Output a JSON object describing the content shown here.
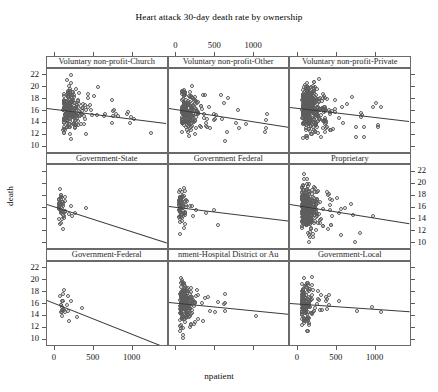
{
  "chart_data": {
    "type": "scatter",
    "title": "Heart attack 30-day death rate by ownership",
    "xlabel": "npatient",
    "ylabel": "death",
    "xlim": [
      -90,
      1450
    ],
    "ylim": [
      9.0,
      23.0
    ],
    "xticks": [
      0,
      500,
      1000
    ],
    "yticks": [
      10,
      12,
      14,
      16,
      18,
      20,
      22
    ],
    "xtick_labels": [
      "0",
      "500",
      "1000"
    ],
    "ytick_labels": [
      "10",
      "12",
      "14",
      "16",
      "18",
      "20",
      "22"
    ],
    "grid": false,
    "legend": "none",
    "layout": {
      "rows": 3,
      "cols": 3,
      "axis_style": "alternating-lattice"
    },
    "panels": [
      {
        "label": "Voluntary non-profit-Church",
        "row": 0,
        "col": 0,
        "n": 230,
        "fit": {
          "intercept": 16.25,
          "slope": -0.00165
        },
        "cluster": {
          "x_mode": 120,
          "x_spread": 210,
          "x_tail": 1150,
          "y_sd": 1.85,
          "seed": 11
        }
      },
      {
        "label": "Voluntary non-profit-Other",
        "row": 0,
        "col": 1,
        "n": 210,
        "fit": {
          "intercept": 16.15,
          "slope": -0.00205
        },
        "cluster": {
          "x_mode": 80,
          "x_spread": 160,
          "x_tail": 1100,
          "y_sd": 1.8,
          "seed": 29
        }
      },
      {
        "label": "Voluntary non-profit-Private",
        "row": 0,
        "col": 2,
        "n": 420,
        "fit": {
          "intercept": 16.3,
          "slope": -0.00155
        },
        "cluster": {
          "x_mode": 70,
          "x_spread": 180,
          "x_tail": 1050,
          "y_sd": 1.9,
          "seed": 47
        }
      },
      {
        "label": "Government-State",
        "row": 1,
        "col": 0,
        "n": 46,
        "fit": {
          "intercept": 16.1,
          "slope": -0.0042
        },
        "cluster": {
          "x_mode": 60,
          "x_spread": 90,
          "x_tail": 700,
          "y_sd": 1.5,
          "seed": 61
        }
      },
      {
        "label": "Government Federal",
        "row": 1,
        "col": 1,
        "n": 78,
        "fit": {
          "intercept": 16.0,
          "slope": -0.0016
        },
        "cluster": {
          "x_mode": 45,
          "x_spread": 70,
          "x_tail": 520,
          "y_sd": 1.45,
          "seed": 83
        }
      },
      {
        "label": "Proprietary",
        "row": 1,
        "col": 2,
        "n": 330,
        "fit": {
          "intercept": 16.2,
          "slope": -0.0021
        },
        "cluster": {
          "x_mode": 60,
          "x_spread": 150,
          "x_tail": 1000,
          "y_sd": 1.95,
          "seed": 97
        }
      },
      {
        "label": "Government-Federal",
        "row": 2,
        "col": 0,
        "n": 22,
        "fit": {
          "intercept": 16.1,
          "slope": -0.0052
        },
        "cluster": {
          "x_mode": 70,
          "x_spread": 110,
          "x_tail": 560,
          "y_sd": 1.2,
          "seed": 113
        }
      },
      {
        "label": "nment-Hospital District or Au",
        "row": 2,
        "col": 1,
        "n": 215,
        "fit": {
          "intercept": 16.05,
          "slope": -0.0013
        },
        "cluster": {
          "x_mode": 60,
          "x_spread": 130,
          "x_tail": 1050,
          "y_sd": 1.75,
          "seed": 131
        }
      },
      {
        "label": "Government-Local",
        "row": 2,
        "col": 2,
        "n": 150,
        "fit": {
          "intercept": 15.95,
          "slope": -0.0009
        },
        "cluster": {
          "x_mode": 55,
          "x_spread": 120,
          "x_tail": 1100,
          "y_sd": 1.7,
          "seed": 149
        }
      }
    ],
    "axis_sides": {
      "top_x_panel": "Voluntary non-profit-Other",
      "bottom_x_panels": [
        "Government-Federal",
        "Government-Local"
      ],
      "left_y_rows": [
        0,
        2
      ],
      "right_y_rows": [
        1
      ]
    },
    "marker": {
      "shape": "open-circle",
      "size_px": 4,
      "color": "#5d5d5d"
    },
    "line_color": "#3a3a3a"
  }
}
